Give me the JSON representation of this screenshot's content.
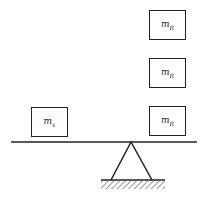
{
  "diagram": {
    "type": "lever-balance",
    "left_mass": {
      "label": "m",
      "subscript": "x"
    },
    "right_masses": [
      {
        "label": "m",
        "subscript": "R"
      },
      {
        "label": "m",
        "subscript": "R"
      },
      {
        "label": "m",
        "subscript": "R"
      }
    ],
    "colors": {
      "line": "#222222",
      "background": "#ffffff"
    }
  }
}
